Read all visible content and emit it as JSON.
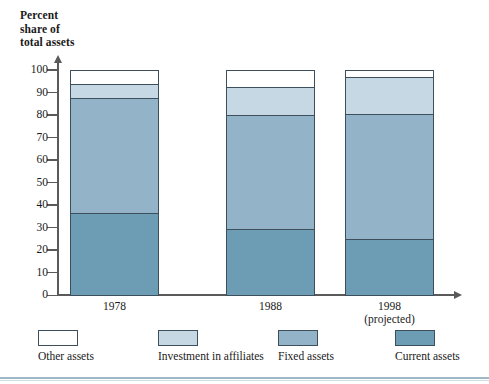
{
  "chart_data": {
    "type": "bar",
    "title": "Percent share of total assets",
    "subtitle": "",
    "xlabel": "",
    "ylabel": "Percent share of total assets",
    "ylim": [
      0,
      100
    ],
    "yticks": [
      0,
      10,
      20,
      30,
      40,
      50,
      60,
      70,
      80,
      90,
      100
    ],
    "grid": false,
    "stacked": true,
    "legend_position": "bottom",
    "categories": [
      "1978",
      "1988",
      "1998"
    ],
    "category_sublabels": [
      "",
      "",
      "(projected)"
    ],
    "series": [
      {
        "name": "Current assets",
        "color": "#6d9cb5",
        "values": [
          36.5,
          29.5,
          25.0
        ]
      },
      {
        "name": "Fixed assets",
        "color": "#93b4c8",
        "values": [
          51.0,
          50.5,
          55.5
        ]
      },
      {
        "name": "Investment in affiliates",
        "color": "#c5d8e4",
        "values": [
          6.5,
          12.5,
          16.5
        ]
      },
      {
        "name": "Other assets",
        "color": "#ffffff",
        "values": [
          6.0,
          7.5,
          3.0
        ]
      }
    ],
    "cumulative_tops": {
      "1978": {
        "current": 36.5,
        "fixed": 87.5,
        "investment": 94.0,
        "other": 100.0
      },
      "1988": {
        "current": 29.5,
        "fixed": 80.0,
        "investment": 92.5,
        "other": 100.0
      },
      "1998": {
        "current": 25.0,
        "fixed": 80.5,
        "investment": 97.0,
        "other": 100.0
      }
    }
  },
  "axis_title": {
    "line1": "Percent",
    "line2": "share of",
    "line3": "total assets"
  },
  "y_ticks": [
    "100",
    "90",
    "80",
    "70",
    "60",
    "50",
    "40",
    "30",
    "20",
    "10",
    "0"
  ],
  "x_labels": [
    {
      "year": "1978",
      "sub": ""
    },
    {
      "year": "1988",
      "sub": ""
    },
    {
      "year": "1998",
      "sub": "(projected)"
    }
  ],
  "legend": {
    "items": [
      {
        "label": "Other assets",
        "color": "#ffffff"
      },
      {
        "label": "Investment in affiliates",
        "color": "#c5d8e4"
      },
      {
        "label": "Fixed assets",
        "color": "#93b4c8"
      },
      {
        "label": "Current assets",
        "color": "#6d9cb5"
      }
    ]
  }
}
